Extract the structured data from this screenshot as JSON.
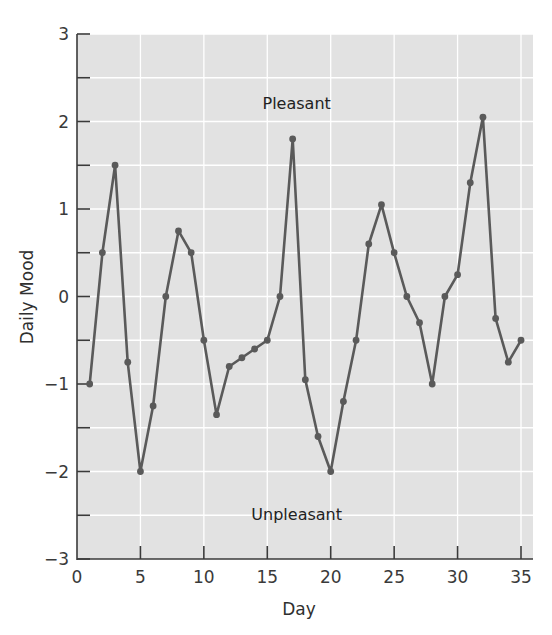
{
  "chart_data": {
    "type": "line",
    "title": "",
    "xlabel": "Day",
    "ylabel": "Daily Mood",
    "xlim": [
      0,
      36
    ],
    "ylim": [
      -3,
      3
    ],
    "x_ticks": [
      0,
      5,
      10,
      15,
      20,
      25,
      30,
      35
    ],
    "x_tick_labels": [
      "0",
      "5",
      "10",
      "15",
      "20",
      "25",
      "30",
      "35"
    ],
    "y_ticks": [
      -3,
      -2,
      -1,
      0,
      1,
      2,
      3
    ],
    "y_tick_labels": [
      "−3",
      "−2",
      "−1",
      "0",
      "1",
      "2",
      "3"
    ],
    "y_minor_ticks": [
      -2.5,
      -1.5,
      -0.5,
      0.5,
      1.5,
      2.5
    ],
    "grid": true,
    "legend": null,
    "annotations": [
      {
        "text": "Pleasant",
        "x": 17,
        "y": 2.2
      },
      {
        "text": "Unpleasant",
        "x": 17,
        "y": -2.5
      }
    ],
    "series": [
      {
        "name": "Daily Mood",
        "x": [
          1,
          2,
          3,
          4,
          5,
          6,
          7,
          8,
          9,
          10,
          11,
          12,
          13,
          14,
          15,
          16,
          17,
          18,
          19,
          20,
          21,
          22,
          23,
          24,
          25,
          26,
          27,
          28,
          29,
          30,
          31,
          32,
          33,
          34,
          35
        ],
        "values": [
          -1,
          0.5,
          1.5,
          -0.75,
          -2,
          -1.25,
          0,
          0.75,
          0.5,
          -0.5,
          -1.35,
          -0.8,
          -0.7,
          -0.6,
          -0.5,
          0,
          1.8,
          -0.95,
          -1.6,
          -2,
          -1.2,
          -0.5,
          0.6,
          1.05,
          0.5,
          0,
          -0.3,
          -1,
          0,
          0.25,
          1.3,
          2.05,
          -0.25,
          -0.75,
          -0.5
        ]
      }
    ],
    "colors": {
      "plot_bg": "#e2e2e2",
      "grid": "#ffffff",
      "line": "#5a5a5a",
      "marker": "#5a5a5a",
      "axis": "#3a3a3a"
    }
  }
}
